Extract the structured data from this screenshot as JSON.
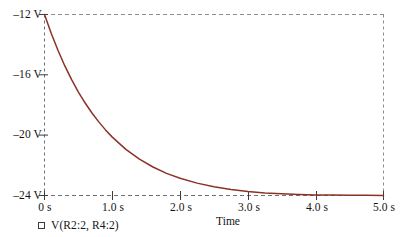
{
  "chart_data": {
    "type": "line",
    "title": "",
    "xlabel": "Time",
    "ylabel": "",
    "xlim": [
      0,
      5
    ],
    "ylim": [
      -24,
      -12
    ],
    "grid": "dashed-border",
    "legend_position": "bottom-left",
    "series": [
      {
        "name": "V(R2:2, R4:2)",
        "color": "#8a3324",
        "x": [
          0.0,
          0.1,
          0.2,
          0.3,
          0.4,
          0.5,
          0.6,
          0.7,
          0.8,
          0.9,
          1.0,
          1.2,
          1.4,
          1.6,
          1.8,
          2.0,
          2.25,
          2.5,
          2.75,
          3.0,
          3.25,
          3.5,
          3.75,
          4.0,
          4.25,
          4.5,
          4.75,
          5.0
        ],
        "y": [
          -12.0,
          -13.26,
          -14.39,
          -15.41,
          -16.32,
          -17.14,
          -17.87,
          -18.53,
          -19.12,
          -19.65,
          -20.13,
          -20.94,
          -21.59,
          -22.11,
          -22.53,
          -22.86,
          -23.18,
          -23.42,
          -23.6,
          -23.73,
          -23.83,
          -23.89,
          -23.93,
          -23.96,
          -23.97,
          -23.98,
          -23.99,
          -24.0
        ]
      }
    ],
    "x_ticks": [
      {
        "value": 0.0,
        "label": "0 s"
      },
      {
        "value": 1.0,
        "label": "1.0 s"
      },
      {
        "value": 2.0,
        "label": "2.0 s"
      },
      {
        "value": 3.0,
        "label": "3.0 s"
      },
      {
        "value": 4.0,
        "label": "4.0 s"
      },
      {
        "value": 5.0,
        "label": "5.0 s"
      }
    ],
    "y_ticks": [
      {
        "value": -12,
        "label": "–12 V"
      },
      {
        "value": -16,
        "label": "–16 V"
      },
      {
        "value": -20,
        "label": "–20 V"
      },
      {
        "value": -24,
        "label": "–24 V"
      }
    ]
  },
  "legend": {
    "marker": "square-marker",
    "label": "V(R2:2, R4:2)"
  },
  "axis": {
    "x_title": "Time"
  },
  "colors": {
    "trace": "#8a3324",
    "grid": "#8c8c96",
    "axis": "#3c3c3c",
    "text": "#141414",
    "background": "#ffffff"
  }
}
